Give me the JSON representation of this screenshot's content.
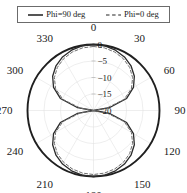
{
  "legend": {
    "position": "top",
    "entries": [
      {
        "label": "Phi=90 deg",
        "style": "solid",
        "color": "#2b2b2b",
        "sample_name": "solid-line-sample"
      },
      {
        "label": "Phi=0 deg",
        "style": "dashed",
        "color": "#6e6e6e",
        "sample_name": "dashed-line-sample"
      }
    ]
  },
  "chart_data": {
    "type": "line",
    "subtype": "polar",
    "title": "",
    "xlabel": "",
    "ylabel": "",
    "angle_unit": "deg",
    "radial_unit": "dB",
    "angle_direction": "clockwise",
    "angle_zero_at": "top",
    "angle_ticks": [
      0,
      30,
      60,
      90,
      120,
      150,
      180,
      210,
      240,
      270,
      300,
      330
    ],
    "angle_tick_labels": [
      "0",
      "30",
      "60",
      "90",
      "120",
      "150",
      "180",
      "210",
      "240",
      "270",
      "300",
      "330"
    ],
    "radial_ticks": [
      0,
      -5,
      -10,
      -15,
      -20
    ],
    "radial_tick_labels": [
      "0",
      "-5",
      "-10",
      "-15",
      "-20"
    ],
    "rlim": [
      -20,
      0
    ],
    "grid": true,
    "legend_position": "top",
    "series": [
      {
        "name": "Phi=90 deg",
        "style": "solid",
        "color": "#2b2b2b",
        "theta": [
          0,
          10,
          20,
          30,
          40,
          50,
          60,
          70,
          80,
          85,
          88,
          90,
          92,
          95,
          100,
          110,
          120,
          130,
          140,
          150,
          160,
          170,
          180,
          190,
          200,
          210,
          220,
          230,
          240,
          250,
          260,
          265,
          270,
          275,
          280,
          290,
          300,
          310,
          320,
          330,
          340,
          350,
          360
        ],
        "r_db": [
          0,
          -0.13,
          -0.54,
          -1.25,
          -2.31,
          -3.84,
          -6.02,
          -9.32,
          -15.14,
          -20.0,
          -20.0,
          -20.0,
          -20.0,
          -20.0,
          -15.14,
          -9.32,
          -6.02,
          -3.84,
          -2.31,
          -1.25,
          -0.54,
          -0.13,
          0,
          -0.13,
          -0.54,
          -1.25,
          -2.31,
          -3.84,
          -6.02,
          -9.32,
          -15.14,
          -20.0,
          -20.0,
          -20.0,
          -15.14,
          -9.32,
          -6.02,
          -3.84,
          -2.31,
          -1.25,
          -0.54,
          -0.13,
          0
        ]
      },
      {
        "name": "Phi=0 deg",
        "style": "dashed",
        "color": "#6e6e6e",
        "theta": [
          0,
          10,
          20,
          30,
          40,
          50,
          60,
          70,
          80,
          85,
          88,
          90,
          92,
          95,
          100,
          110,
          120,
          130,
          140,
          150,
          160,
          170,
          180,
          190,
          200,
          210,
          220,
          230,
          240,
          250,
          260,
          265,
          270,
          275,
          280,
          290,
          300,
          310,
          320,
          330,
          340,
          350,
          360
        ],
        "r_db": [
          -0.6,
          -0.74,
          -1.16,
          -1.88,
          -2.96,
          -4.52,
          -6.74,
          -10.1,
          -16.0,
          -20.0,
          -20.0,
          -20.0,
          -20.0,
          -20.0,
          -16.0,
          -10.1,
          -6.74,
          -4.52,
          -2.96,
          -1.88,
          -1.16,
          -0.74,
          -0.6,
          -0.74,
          -1.16,
          -1.88,
          -2.96,
          -4.52,
          -6.74,
          -10.1,
          -16.0,
          -20.0,
          -20.0,
          -20.0,
          -16.0,
          -10.1,
          -6.74,
          -4.52,
          -2.96,
          -1.88,
          -1.16,
          -0.74,
          -0.6
        ]
      }
    ]
  }
}
